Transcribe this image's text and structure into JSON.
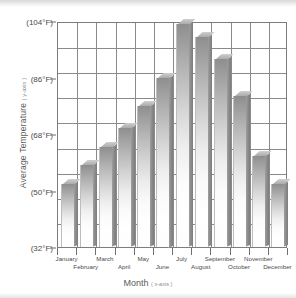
{
  "chart_data": {
    "type": "bar",
    "title": "",
    "subtitle": "",
    "xlabel": "Month",
    "xlabel_note": "( x-axis )",
    "ylabel": "Average Temperature",
    "ylabel_note": "( y-axis )",
    "categories": [
      "January",
      "February",
      "March",
      "April",
      "May",
      "June",
      "July",
      "August",
      "September",
      "October",
      "November",
      "December"
    ],
    "values": [
      52,
      58,
      64,
      70,
      77,
      86,
      103,
      99,
      92,
      80,
      61,
      52
    ],
    "value_unit": "°F",
    "ylim": [
      32,
      104
    ],
    "ytick_labels": [
      "(104°F)",
      "(86°F)",
      "(68°F)",
      "(50°F)",
      "(32°F)"
    ],
    "ytick_values": [
      104,
      86,
      68,
      50,
      32
    ],
    "grid": true,
    "gridlines_y_count": 9,
    "legend": "none",
    "bar_style": "3d-gradient-gray",
    "colors": {
      "bar_top_fill": "#8e8e8e",
      "bar_bottom_fill": "#ffffff",
      "bar_side": "#8d8d8d",
      "bar_cap": "#ababab",
      "grid": "#8a8a8a",
      "axis": "#7d7d7d",
      "label_text": "#4a4a4a",
      "title_text": "#5a5a5a",
      "note_text": "#8f8f8f",
      "background": "#ffffff"
    }
  }
}
